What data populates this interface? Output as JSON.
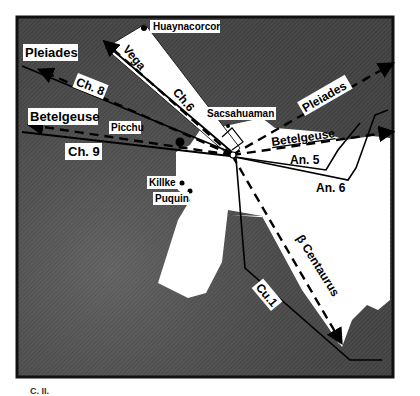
{
  "figure": {
    "type": "map-diagram",
    "colors": {
      "background_shade": "#4a4a4a",
      "highlight_region": "#ffffff",
      "line": "#000000",
      "label_box": "#ffffff"
    },
    "places": [
      {
        "name": "Huaynacorcor"
      },
      {
        "name": "Sacsahuaman"
      },
      {
        "name": "Picchu"
      },
      {
        "name": "Killke"
      },
      {
        "name": "Puquin"
      }
    ],
    "star_alignments": [
      {
        "name": "Pleiades",
        "side": "west",
        "style": "dashed-arrow"
      },
      {
        "name": "Betelgeuse",
        "side": "west",
        "style": "dashed-arrow"
      },
      {
        "name": "Vega",
        "style": "dashed"
      },
      {
        "name": "Pleiades",
        "side": "east",
        "style": "dashed-arrow"
      },
      {
        "name": "Betelgeuse",
        "side": "east",
        "style": "dashed-arrow"
      },
      {
        "name": "β Centaurus",
        "style": "dashed-arrow"
      }
    ],
    "ceque_lines": [
      {
        "name": "Ch. 8"
      },
      {
        "name": "Ch. 9"
      },
      {
        "name": "Ch.6"
      },
      {
        "name": "An. 5"
      },
      {
        "name": "An. 6"
      },
      {
        "name": "Cu.1"
      }
    ],
    "labels": {
      "huaynacorcor": "Huaynacorcor",
      "pleiades_w": "Pleiades",
      "ch8": "Ch. 8",
      "vega": "Vega",
      "ch6": "Ch.6",
      "sacsahuaman": "Sacsahuaman",
      "pleiades_e": "Pleiades",
      "betelgeuse_w": "Betelgeuse",
      "picchu": "Picchu",
      "betelgeuse_e": "Betelgeuse",
      "an5": "An. 5",
      "ch9": "Ch. 9",
      "an6": "An. 6",
      "killke": "Killke",
      "puquin": "Puquin",
      "beta_centaurus": "β Centaurus",
      "cu1": "Cu.1"
    },
    "caption_fragment": "C. II."
  }
}
